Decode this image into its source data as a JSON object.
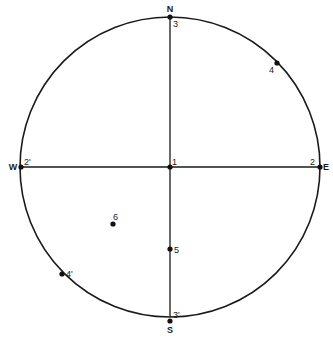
{
  "diagram": {
    "type": "stereographic-projection",
    "circle": {
      "cx": 170,
      "cy": 167,
      "r": 150,
      "stroke": "#1a1a1a"
    },
    "axes": {
      "ns": {
        "x1": 170,
        "y1": 17,
        "x2": 170,
        "y2": 317
      },
      "ew": {
        "x1": 20,
        "y1": 167,
        "x2": 320,
        "y2": 167
      }
    },
    "cardinals": [
      {
        "id": "N",
        "label": "N",
        "x": 170,
        "y": 12,
        "anchor": "middle"
      },
      {
        "id": "S",
        "label": "S",
        "x": 170,
        "y": 333,
        "anchor": "middle"
      },
      {
        "id": "W",
        "label": "W",
        "x": 13,
        "y": 170,
        "anchor": "middle"
      },
      {
        "id": "E",
        "label": "E",
        "x": 326,
        "y": 170,
        "anchor": "middle"
      }
    ],
    "points": [
      {
        "id": "p3",
        "label": "3",
        "x": 170,
        "y": 17,
        "lx": 173,
        "ly": 27
      },
      {
        "id": "p4",
        "label": "4",
        "x": 277,
        "y": 63,
        "lx": 269,
        "ly": 73
      },
      {
        "id": "p2prime",
        "label": "2'",
        "x": 21,
        "y": 167,
        "lx": 24,
        "ly": 165
      },
      {
        "id": "p1",
        "label": "1",
        "x": 170,
        "y": 167,
        "lx": 172,
        "ly": 165
      },
      {
        "id": "p2",
        "label": "2",
        "x": 320,
        "y": 167,
        "lx": 310,
        "ly": 165
      },
      {
        "id": "p6",
        "label": "6",
        "x": 113,
        "y": 224,
        "lx": 113,
        "ly": 220
      },
      {
        "id": "p5",
        "label": "5",
        "x": 170,
        "y": 249,
        "lx": 174,
        "ly": 253
      },
      {
        "id": "p4prime",
        "label": "4'",
        "x": 62,
        "y": 274,
        "lx": 66,
        "ly": 277
      },
      {
        "id": "p3prime",
        "label": "3'",
        "x": 170,
        "y": 321,
        "lx": 173,
        "ly": 318
      }
    ]
  }
}
